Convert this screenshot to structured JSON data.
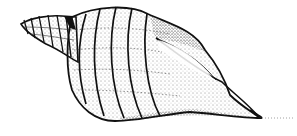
{
  "illustration": {
    "subject": "seashell line drawing",
    "style": "black ink outline with stippled shading",
    "colors": {
      "ink": "#111111",
      "background": "#ffffff"
    }
  }
}
